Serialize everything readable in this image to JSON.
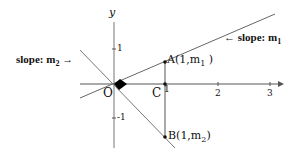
{
  "diagram": {
    "axes": {
      "x_label": "",
      "y_label": "y",
      "x_ticks": [
        "1",
        "2",
        "3"
      ],
      "y_ticks": [
        "1",
        "-1"
      ]
    },
    "origin_label": "O",
    "point_c": "C",
    "point_a": {
      "name": "A(1,m",
      "sub": "1",
      "close": " )"
    },
    "point_b": {
      "name": "B(1,m",
      "sub": "2",
      "close": ")"
    },
    "slope1": {
      "text": "slope: m",
      "sub": "1",
      "arrow": "←"
    },
    "slope2": {
      "text": "slope: m",
      "sub": "2",
      "arrow": "→"
    },
    "colors": {
      "axes": "#555555",
      "lines": "#666666",
      "text": "#111111"
    }
  }
}
